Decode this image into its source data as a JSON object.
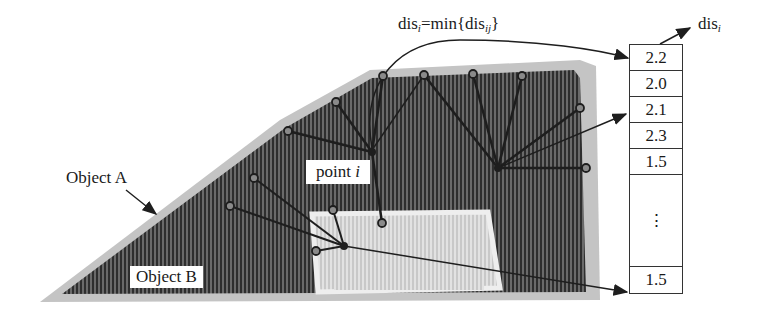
{
  "labels": {
    "formula_prefix": "dis",
    "formula_sub_i": "i",
    "formula_mid": "=min{dis",
    "formula_sub_ij": "ij",
    "formula_suffix": "}",
    "object_a": "Object A",
    "object_b": "Object B",
    "point_prefix": "point ",
    "point_var": "i",
    "dis_label": "dis",
    "dis_sub": "i"
  },
  "table": {
    "values": [
      "2.2",
      "2.0",
      "2.1",
      "2.3",
      "1.5",
      "⋮",
      "1.5"
    ]
  },
  "colors": {
    "object_a_fill": "#5a5a5a",
    "object_a_edge": "#b8b8b8",
    "object_b_fill": "#d9d9d9",
    "line": "#1e1e1e"
  }
}
